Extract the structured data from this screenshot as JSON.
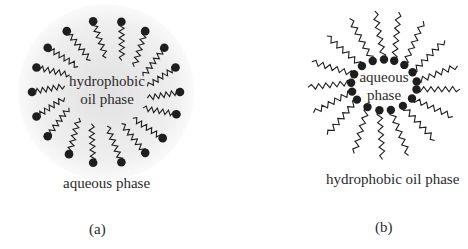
{
  "figure": {
    "panels": [
      {
        "id": "a",
        "type": "normal-micelle",
        "caption": "(a)",
        "core_label_line1": "hydrophobic",
        "core_label_line2": "oil phase",
        "outer_label": "aqueous phase",
        "center": [
          106,
          92
        ],
        "head_radius": 74,
        "tail_inner_radius": 28,
        "head_dot_radius": 4.3,
        "head_angles_deg": [
          -100,
          -78,
          -58,
          -38,
          -20,
          0,
          18,
          40,
          58,
          78,
          100,
          120,
          142,
          160,
          180,
          200,
          218,
          238
        ],
        "halo_color": "#d8d8d8"
      },
      {
        "id": "b",
        "type": "reverse-micelle",
        "caption": "(b)",
        "core_label_line1": "aqueous",
        "core_label_line2": "phase",
        "outer_label": "hydrophobic oil  phase",
        "center": [
          150,
          85
        ],
        "head_radius": 30,
        "tail_outer_radius": 76,
        "head_dot_radius": 4.2,
        "head_angles_deg": [
          -110,
          -90,
          -72,
          -52,
          -30,
          -8,
          10,
          32,
          55,
          78,
          98,
          120,
          145,
          165,
          185,
          205,
          228
        ]
      }
    ],
    "colors": {
      "ink": "#1e1e1e",
      "text": "#2a2a2a",
      "background": "#ffffff"
    }
  }
}
